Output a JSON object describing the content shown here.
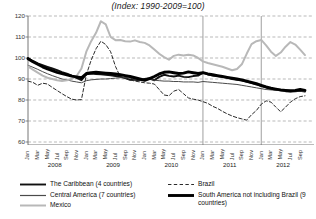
{
  "chart": {
    "title": "(Index: 1990-2009=100)",
    "y_axis": {
      "labels": [
        "120",
        "110",
        "100",
        "90",
        "80",
        "70",
        "60"
      ]
    },
    "month_ticks": [
      "Jan",
      "Mar",
      "May",
      "Jul",
      "Sep",
      "Nov"
    ],
    "years": [
      "2008",
      "2009",
      "2010",
      "2011",
      "2012"
    ]
  },
  "legend": {
    "items": [
      {
        "label": "The Caribbean (4 countries)",
        "style": "solid",
        "color": "#101010",
        "width": 1.9,
        "icon": "line-swatch-icon"
      },
      {
        "label": "Central America (7 countries)",
        "style": "solid",
        "color": "#4a4a4a",
        "width": 1.0,
        "icon": "line-swatch-icon"
      },
      {
        "label": "Mexico",
        "style": "solid",
        "color": "#b8b8b8",
        "width": 2.0,
        "icon": "line-swatch-icon"
      },
      {
        "label": "Brazil",
        "style": "dashed",
        "color": "#2b2b2b",
        "width": 1.0,
        "icon": "dashed-line-swatch-icon"
      },
      {
        "label": "South America not including Brazil (9 countries)",
        "style": "solid",
        "color": "#000000",
        "width": 2.9,
        "icon": "thick-line-swatch-icon"
      }
    ]
  },
  "chart_data": {
    "type": "line",
    "title": "(Index: 1990-2009=100)",
    "xlabel": "",
    "ylabel": "",
    "ylim": [
      60,
      120
    ],
    "yticks": [
      60,
      70,
      80,
      90,
      100,
      110,
      120
    ],
    "grid": true,
    "legend_position": "bottom",
    "x": [
      "2008-01",
      "2008-02",
      "2008-03",
      "2008-04",
      "2008-05",
      "2008-06",
      "2008-07",
      "2008-08",
      "2008-09",
      "2008-10",
      "2008-11",
      "2008-12",
      "2009-01",
      "2009-02",
      "2009-03",
      "2009-04",
      "2009-05",
      "2009-06",
      "2009-07",
      "2009-08",
      "2009-09",
      "2009-10",
      "2009-11",
      "2009-12",
      "2010-01",
      "2010-02",
      "2010-03",
      "2010-04",
      "2010-05",
      "2010-06",
      "2010-07",
      "2010-08",
      "2010-09",
      "2010-10",
      "2010-11",
      "2010-12",
      "2011-01",
      "2011-02",
      "2011-03",
      "2011-04",
      "2011-05",
      "2011-06",
      "2011-07",
      "2011-08",
      "2011-09",
      "2011-10",
      "2011-11",
      "2011-12",
      "2012-01",
      "2012-02",
      "2012-03",
      "2012-04",
      "2012-05",
      "2012-06",
      "2012-07",
      "2012-08",
      "2012-09",
      "2012-10"
    ],
    "series": [
      {
        "name": "The Caribbean (4 countries)",
        "color": "#101010",
        "style": "solid",
        "width": 1.9,
        "values": [
          100.0,
          98.6,
          97.4,
          96.6,
          95.8,
          95.0,
          94.2,
          93.3,
          92.6,
          91.6,
          90.5,
          89.4,
          92.2,
          92.6,
          92.4,
          92.2,
          92.0,
          91.8,
          91.4,
          91.0,
          90.4,
          89.6,
          89.6,
          89.4,
          90.0,
          90.4,
          89.4,
          91.0,
          92.0,
          91.5,
          91.2,
          91.6,
          91.0,
          90.9,
          91.4,
          91.6,
          93.0,
          92.2,
          91.6,
          91.3,
          91.0,
          90.6,
          90.0,
          89.6,
          89.2,
          88.6,
          88.0,
          87.4,
          86.6,
          86.0,
          85.4,
          85.0,
          84.6,
          84.2,
          84.0,
          84.2,
          84.4,
          84.0
        ]
      },
      {
        "name": "Central America (7 countries)",
        "color": "#4a4a4a",
        "style": "solid",
        "width": 1.0,
        "values": [
          96.5,
          95.6,
          94.6,
          93.5,
          92.5,
          91.6,
          90.8,
          90.0,
          89.6,
          89.0,
          88.6,
          88.2,
          89.2,
          89.6,
          89.8,
          90.0,
          90.0,
          90.2,
          90.4,
          90.6,
          90.8,
          90.4,
          89.8,
          89.4,
          89.6,
          89.8,
          89.4,
          89.2,
          89.0,
          89.0,
          88.8,
          88.8,
          88.6,
          88.6,
          88.6,
          88.4,
          88.8,
          88.6,
          88.4,
          88.2,
          88.0,
          87.8,
          87.6,
          87.4,
          87.0,
          86.6,
          86.2,
          85.8,
          85.4,
          85.0,
          84.8,
          84.6,
          84.4,
          84.4,
          84.4,
          84.4,
          84.2,
          84.0
        ]
      },
      {
        "name": "Mexico",
        "color": "#b8b8b8",
        "style": "solid",
        "width": 2.0,
        "values": [
          96.0,
          94.5,
          93.0,
          91.6,
          90.6,
          90.0,
          89.4,
          89.0,
          89.4,
          90.0,
          91.4,
          95.0,
          103.0,
          108.0,
          112.0,
          117.5,
          116.0,
          110.0,
          108.5,
          108.6,
          108.0,
          107.8,
          108.4,
          107.6,
          107.2,
          106.0,
          104.0,
          102.0,
          100.4,
          99.2,
          101.0,
          101.6,
          101.2,
          101.6,
          101.2,
          100.0,
          98.4,
          97.6,
          97.0,
          96.4,
          95.8,
          95.0,
          94.2,
          94.8,
          97.0,
          102.0,
          106.6,
          108.0,
          108.6,
          106.0,
          103.0,
          101.0,
          102.6,
          105.4,
          107.6,
          106.4,
          104.0,
          101.4
        ]
      },
      {
        "name": "Brazil",
        "color": "#2b2b2b",
        "style": "dashed",
        "width": 1.0,
        "values": [
          89.0,
          88.4,
          87.0,
          88.0,
          87.6,
          86.0,
          84.5,
          83.0,
          81.6,
          80.4,
          80.0,
          80.2,
          92.0,
          99.0,
          104.4,
          108.0,
          106.4,
          103.0,
          96.0,
          91.0,
          90.4,
          89.6,
          89.0,
          88.6,
          88.2,
          88.0,
          87.6,
          85.0,
          82.4,
          82.0,
          84.2,
          85.0,
          83.0,
          81.0,
          80.4,
          80.0,
          79.2,
          78.4,
          77.0,
          76.0,
          74.6,
          73.4,
          72.4,
          71.6,
          71.0,
          70.4,
          73.0,
          75.0,
          78.0,
          79.6,
          79.0,
          76.6,
          74.4,
          76.6,
          79.0,
          80.6,
          81.6,
          82.0
        ]
      },
      {
        "name": "South America not including Brazil (9 countries)",
        "color": "#000000",
        "style": "solid",
        "width": 2.9,
        "values": [
          99.6,
          98.2,
          97.0,
          95.8,
          94.8,
          94.0,
          93.2,
          92.6,
          92.0,
          91.4,
          91.0,
          90.6,
          92.6,
          93.0,
          93.2,
          93.0,
          92.8,
          92.6,
          92.4,
          92.0,
          91.6,
          91.2,
          90.6,
          90.0,
          89.4,
          90.2,
          91.2,
          92.4,
          93.2,
          93.4,
          93.0,
          92.6,
          92.8,
          93.4,
          93.0,
          92.6,
          93.0,
          92.4,
          92.0,
          91.6,
          91.2,
          90.8,
          90.4,
          90.0,
          89.6,
          89.0,
          88.4,
          87.8,
          87.0,
          86.2,
          85.6,
          85.2,
          84.8,
          84.6,
          84.4,
          84.6,
          85.0,
          84.6
        ]
      }
    ]
  }
}
